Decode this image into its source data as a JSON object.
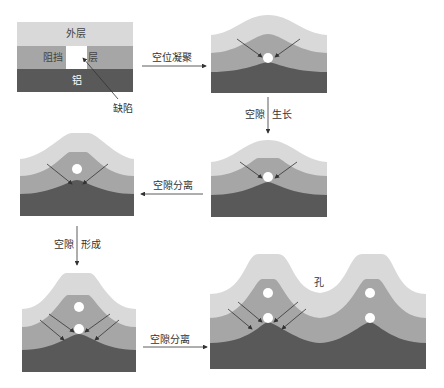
{
  "colors": {
    "outer": "#d9d9d9",
    "barrier": "#a6a6a6",
    "aluminum": "#595959",
    "void": "#ffffff",
    "arrow": "#333333"
  },
  "labels": {
    "outer_layer": "外层",
    "barrier_left": "阻挡",
    "barrier_right": "层",
    "aluminum": "铝",
    "defect": "缺陷",
    "hole": "孔"
  },
  "steps": {
    "step1": "空位凝聚",
    "step2_a": "空隙",
    "step2_b": "生长",
    "step3": "空隙分离",
    "step4_a": "空隙",
    "step4_b": "形成",
    "step5": "空隙分离"
  }
}
